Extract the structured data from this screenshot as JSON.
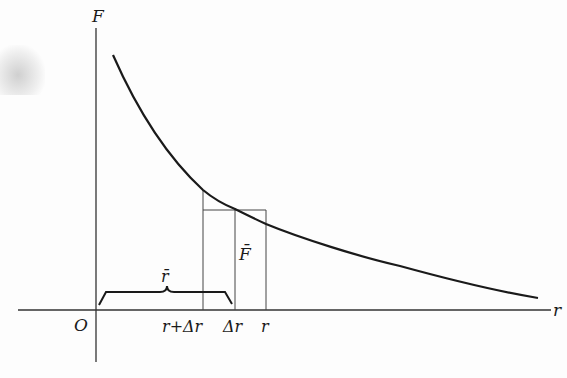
{
  "figure": {
    "axes": {
      "y_label": "F",
      "x_label": "r",
      "origin_label": "O"
    },
    "curve": {
      "description": "decreasing curve F(r), like inverse-square force",
      "color": "#1a1a1a"
    },
    "markers": {
      "left_line_label": "r+Δr",
      "middle_line_label": "Δr",
      "right_line_label": "r"
    },
    "annotations": {
      "brace_label": "r̄",
      "mean_force_label": "F̄"
    }
  }
}
